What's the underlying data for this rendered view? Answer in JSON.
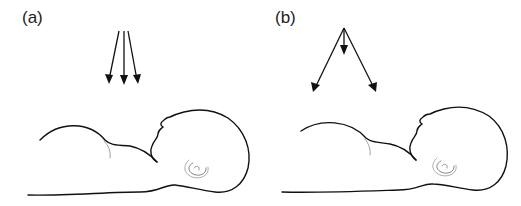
{
  "panels": [
    {
      "label": "(a)",
      "description": "infant lying supine with parallel (collimated) arrows directed downward"
    },
    {
      "label": "(b)",
      "description": "infant lying supine with diverging arrows from a single point source"
    }
  ],
  "colors": {
    "line": "#111111",
    "background": "#ffffff",
    "ear": "#555555"
  }
}
